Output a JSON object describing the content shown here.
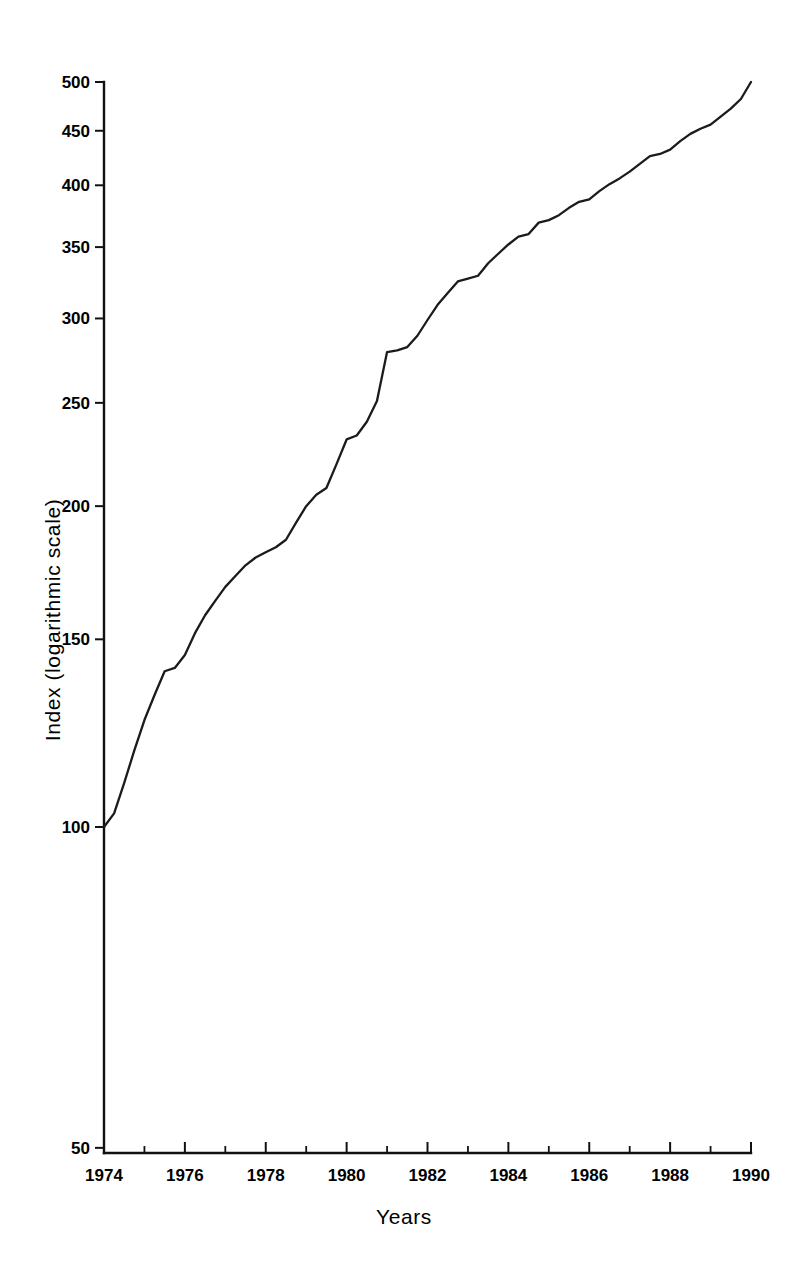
{
  "chart_data": {
    "type": "line",
    "title": "",
    "xlabel": "Years",
    "ylabel": "Index (logarithmic scale)",
    "y_scale": "log",
    "ylim": [
      50,
      500
    ],
    "xlim": [
      1974,
      1990
    ],
    "grid": false,
    "legend": null,
    "y_ticks": [
      50,
      100,
      150,
      200,
      250,
      300,
      350,
      400,
      450,
      500
    ],
    "y_tick_labels": [
      "50",
      "100",
      "150",
      "200",
      "250",
      "300",
      "350",
      "400",
      "450",
      "500"
    ],
    "x_ticks": [
      1974,
      1975,
      1976,
      1977,
      1978,
      1979,
      1980,
      1981,
      1982,
      1983,
      1984,
      1985,
      1986,
      1987,
      1988,
      1989,
      1990
    ],
    "x_tick_labels": [
      "1974",
      "",
      "1976",
      "",
      "1978",
      "",
      "1980",
      "",
      "1982",
      "",
      "1984",
      "",
      "1986",
      "",
      "1988",
      "",
      "1990"
    ],
    "series": [
      {
        "name": "Index",
        "x": [
          1974.0,
          1974.25,
          1974.5,
          1974.75,
          1975.0,
          1975.25,
          1975.5,
          1975.75,
          1976.0,
          1976.25,
          1976.5,
          1976.75,
          1977.0,
          1977.25,
          1977.5,
          1977.75,
          1978.0,
          1978.25,
          1978.5,
          1978.75,
          1979.0,
          1979.25,
          1979.5,
          1979.75,
          1980.0,
          1980.25,
          1980.5,
          1980.75,
          1981.0,
          1981.25,
          1981.5,
          1981.75,
          1982.0,
          1982.25,
          1982.5,
          1982.75,
          1983.0,
          1983.25,
          1983.5,
          1983.75,
          1984.0,
          1984.25,
          1984.5,
          1984.75,
          1985.0,
          1985.25,
          1985.5,
          1985.75,
          1986.0,
          1986.25,
          1986.5,
          1986.75,
          1987.0,
          1987.25,
          1987.5,
          1987.75,
          1988.0,
          1988.25,
          1988.5,
          1988.75,
          1989.0,
          1989.25,
          1989.5,
          1989.75,
          1990.0
        ],
        "values": [
          100,
          103,
          110,
          118,
          126,
          133,
          140,
          141,
          145,
          152,
          158,
          163,
          168,
          172,
          176,
          179,
          181,
          183,
          186,
          193,
          200,
          205,
          208,
          219,
          231,
          233,
          240,
          251,
          279,
          280,
          282,
          289,
          299,
          309,
          317,
          325,
          327,
          329,
          338,
          345,
          352,
          358,
          360,
          369,
          371,
          375,
          381,
          386,
          388,
          395,
          401,
          406,
          412,
          419,
          426,
          428,
          432,
          440,
          447,
          452,
          456,
          464,
          472,
          482,
          500
        ]
      }
    ]
  },
  "axes": {
    "x_label": "Years",
    "y_label": "Index (logarithmic scale)"
  }
}
